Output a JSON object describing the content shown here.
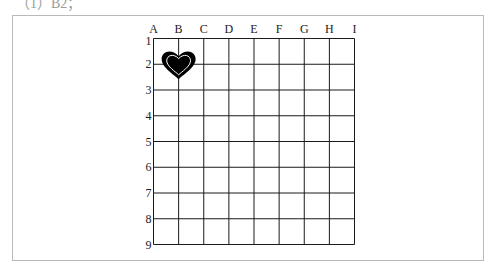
{
  "top_text": "（1）B2；",
  "grid": {
    "columns": [
      "A",
      "B",
      "C",
      "D",
      "E",
      "F",
      "G",
      "H",
      "I"
    ],
    "rows": [
      "1",
      "2",
      "3",
      "4",
      "5",
      "6",
      "7",
      "8",
      "9"
    ],
    "line_color": "#1a1a1a",
    "frame_color": "#b9b9b9"
  },
  "marker": {
    "shape": "heart",
    "position": "B2",
    "fill": "#000000",
    "inner_outline": "#ffffff"
  }
}
